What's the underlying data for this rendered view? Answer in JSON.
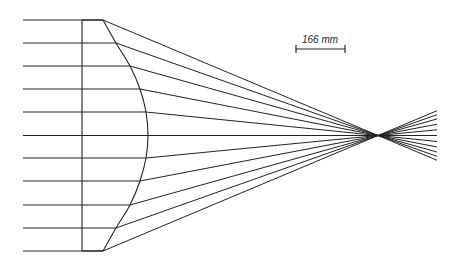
{
  "diagram": {
    "type": "optical ray trace",
    "colors": {
      "line": "#222222",
      "background": "#ffffff"
    },
    "rays": {
      "count": 11,
      "start_x": 23,
      "y_positions": [
        20,
        43,
        66,
        89,
        112,
        135.5,
        158,
        181,
        205,
        228,
        251
      ],
      "curve_intersections_x": [
        103,
        116,
        130,
        140,
        146,
        148,
        146,
        140,
        130,
        116,
        103
      ],
      "focus": {
        "x": 378,
        "y": 135.5
      },
      "end_x": 437,
      "end_spread": {
        "top_y": 111,
        "bottom_y": 160
      }
    },
    "lens": {
      "flat_face_x": 82,
      "top_y": 20,
      "bottom_y": 251,
      "edge_x": 103,
      "apex_x": 148,
      "apex_y": 135.5
    },
    "scale_bar": {
      "label": "166 mm",
      "x1": 296,
      "x2": 345,
      "y": 49,
      "label_x": 320,
      "label_y": 43
    }
  }
}
